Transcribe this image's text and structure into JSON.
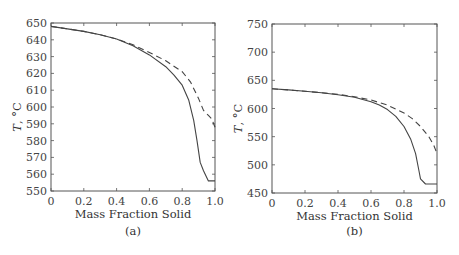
{
  "chart_data": [
    {
      "type": "line",
      "panel_label": "(a)",
      "xlabel": "Mass Fraction Solid",
      "ylabel": "T, °C",
      "xlim": [
        0,
        1.0
      ],
      "ylim": [
        550,
        650
      ],
      "xticks": [
        "0",
        "0.2",
        "0.4",
        "0.6",
        "0.8",
        "1.0"
      ],
      "yticks": [
        "550",
        "560",
        "570",
        "580",
        "590",
        "600",
        "610",
        "620",
        "630",
        "640",
        "650"
      ],
      "grid": false,
      "series": [
        {
          "name": "solid",
          "style": "solid",
          "x": [
            0,
            0.1,
            0.2,
            0.3,
            0.4,
            0.5,
            0.6,
            0.7,
            0.75,
            0.8,
            0.84,
            0.87,
            0.89,
            0.91,
            0.93,
            0.96,
            1.0
          ],
          "y": [
            648,
            646.5,
            645,
            643,
            640.5,
            636.5,
            631,
            624,
            619,
            613,
            604,
            592,
            580,
            567,
            562,
            556,
            556
          ]
        },
        {
          "name": "dashed",
          "style": "dashed",
          "x": [
            0,
            0.1,
            0.2,
            0.3,
            0.4,
            0.5,
            0.6,
            0.7,
            0.8,
            0.85,
            0.9,
            0.93,
            0.96,
            0.98,
            1.0
          ],
          "y": [
            648,
            646.5,
            645,
            643,
            640.5,
            637,
            632.5,
            627.5,
            621,
            615,
            605,
            598,
            595,
            593,
            588
          ]
        }
      ]
    },
    {
      "type": "line",
      "panel_label": "(b)",
      "xlabel": "Mass Fraction Solid",
      "ylabel": "T, °C",
      "xlim": [
        0,
        1.0
      ],
      "ylim": [
        450,
        750
      ],
      "xticks": [
        "0",
        "0.2",
        "0.4",
        "0.6",
        "0.8",
        "1.0"
      ],
      "yticks": [
        "450",
        "500",
        "550",
        "600",
        "650",
        "700",
        "750"
      ],
      "grid": false,
      "series": [
        {
          "name": "solid",
          "style": "solid",
          "x": [
            0,
            0.1,
            0.2,
            0.3,
            0.4,
            0.5,
            0.6,
            0.65,
            0.7,
            0.75,
            0.8,
            0.84,
            0.87,
            0.89,
            0.9,
            0.93,
            1.0
          ],
          "y": [
            635,
            633,
            630.5,
            628,
            624.5,
            620,
            612,
            606,
            598,
            586,
            568,
            546,
            520,
            490,
            475,
            466,
            466
          ]
        },
        {
          "name": "dashed",
          "style": "dashed",
          "x": [
            0,
            0.1,
            0.2,
            0.3,
            0.4,
            0.5,
            0.6,
            0.7,
            0.8,
            0.85,
            0.9,
            0.95,
            0.98,
            1.0
          ],
          "y": [
            635,
            633,
            630.5,
            628,
            625,
            621,
            615,
            606,
            592,
            582,
            568,
            550,
            535,
            520
          ]
        }
      ]
    }
  ]
}
